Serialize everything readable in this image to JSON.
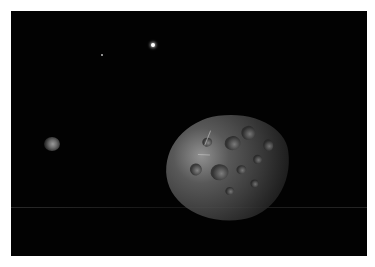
{
  "scene": {
    "type": "space render",
    "subject": "cratered asteroid",
    "background_color": "#020202",
    "objects": [
      {
        "name": "asteroid",
        "description": "large cratered grey asteroid, lower right"
      },
      {
        "name": "distant-planet",
        "description": "small hazy grey sphere, left"
      },
      {
        "name": "bright-star",
        "description": "bright point light, top center"
      },
      {
        "name": "faint-star",
        "description": "faint point, top left"
      }
    ]
  }
}
